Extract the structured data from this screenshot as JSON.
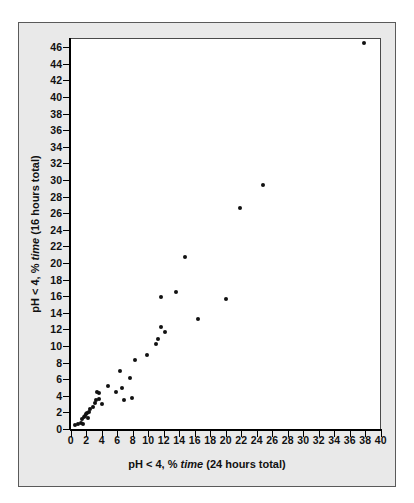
{
  "figure": {
    "background_color": "#ffffff",
    "panel_color": "#e9e9e9",
    "plot_background": "#ffffff",
    "marker_color": "#111111",
    "axis_color": "#000000"
  },
  "axes": {
    "x_label_pre": "pH < 4, % ",
    "x_label_italic": "time",
    "x_label_post": " (24 hours total)",
    "y_label_pre": "pH < 4, % ",
    "y_label_italic": "time",
    "y_label_post": " (16 hours total)",
    "x_ticks": [
      0,
      2,
      4,
      6,
      8,
      10,
      12,
      14,
      16,
      18,
      20,
      22,
      24,
      26,
      28,
      30,
      32,
      34,
      36,
      38,
      40
    ],
    "y_ticks": [
      0,
      2,
      4,
      6,
      8,
      10,
      12,
      14,
      16,
      18,
      20,
      22,
      24,
      26,
      28,
      30,
      32,
      34,
      36,
      38,
      40,
      42,
      44,
      46
    ]
  },
  "chart_data": {
    "type": "scatter",
    "title": "",
    "xlabel": "pH < 4, % time (24 hours total)",
    "ylabel": "pH < 4, % time (16 hours total)",
    "xlim": [
      0,
      40
    ],
    "ylim": [
      0,
      47
    ],
    "grid": false,
    "legend": false,
    "marker": "filled-circle",
    "series": [
      {
        "name": "patients",
        "points": [
          [
            0.6,
            0.5
          ],
          [
            1.0,
            0.6
          ],
          [
            1.3,
            0.7
          ],
          [
            1.6,
            0.6
          ],
          [
            1.5,
            1.2
          ],
          [
            1.7,
            1.5
          ],
          [
            1.9,
            1.6
          ],
          [
            2.0,
            1.8
          ],
          [
            2.1,
            1.9
          ],
          [
            2.2,
            1.3
          ],
          [
            2.4,
            2.0
          ],
          [
            2.5,
            2.4
          ],
          [
            2.9,
            2.6
          ],
          [
            3.1,
            3.1
          ],
          [
            3.3,
            3.5
          ],
          [
            3.4,
            4.5
          ],
          [
            3.6,
            4.3
          ],
          [
            3.7,
            3.6
          ],
          [
            4.1,
            3.0
          ],
          [
            4.8,
            5.2
          ],
          [
            5.9,
            4.5
          ],
          [
            6.3,
            7.0
          ],
          [
            6.6,
            4.9
          ],
          [
            6.9,
            3.5
          ],
          [
            7.6,
            6.1
          ],
          [
            7.9,
            3.7
          ],
          [
            8.3,
            8.3
          ],
          [
            9.9,
            8.9
          ],
          [
            11.0,
            10.3
          ],
          [
            11.3,
            10.9
          ],
          [
            11.6,
            12.3
          ],
          [
            11.7,
            15.9
          ],
          [
            12.2,
            11.7
          ],
          [
            13.6,
            16.5
          ],
          [
            14.8,
            20.7
          ],
          [
            16.4,
            13.2
          ],
          [
            20.0,
            15.7
          ],
          [
            21.8,
            26.6
          ],
          [
            24.8,
            29.4
          ],
          [
            37.8,
            46.5
          ]
        ]
      }
    ]
  }
}
